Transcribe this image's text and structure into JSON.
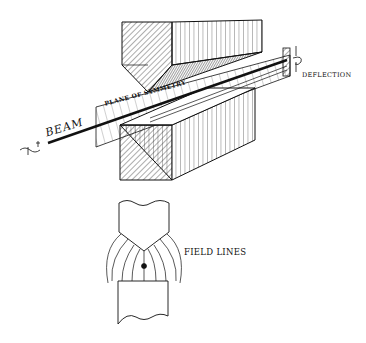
{
  "diagram": {
    "title": "",
    "colors": {
      "ink": "#111111",
      "background": "#ffffff"
    },
    "labels": {
      "beam": "BEAM",
      "plane": "PLANE OF SYMMETRY",
      "deflection": "DEFLECTION",
      "field_lines": "FIELD LINES"
    },
    "nodes": [
      {
        "id": "upper-pole",
        "label": "Upper pole piece (wedge tip down)"
      },
      {
        "id": "lower-pole",
        "label": "Lower pole piece (flat face up)"
      },
      {
        "id": "beam",
        "label": "BEAM"
      },
      {
        "id": "plane",
        "label": "PLANE OF SYMMETRY"
      },
      {
        "id": "screen",
        "label": "Detector screen"
      },
      {
        "id": "deflection",
        "label": "DEFLECTION"
      },
      {
        "id": "cross-section",
        "label": "Cross-section with FIELD LINES"
      }
    ],
    "edges": [
      {
        "from": "beam",
        "to": "screen",
        "label": "passes between pole pieces"
      },
      {
        "from": "screen",
        "to": "deflection",
        "label": "displacement marked"
      }
    ]
  }
}
